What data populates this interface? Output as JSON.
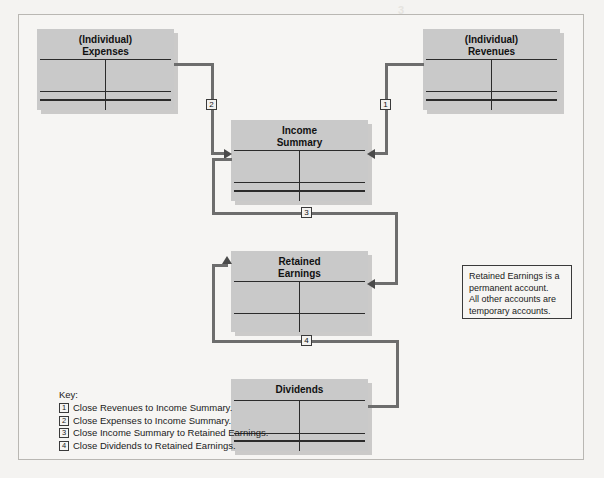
{
  "diagram": {
    "accounts": [
      {
        "id": "individual-expenses",
        "title_line1": "(Individual)",
        "title_line2": "Expenses"
      },
      {
        "id": "individual-revenues",
        "title_line1": "(Individual)",
        "title_line2": "Revenues"
      },
      {
        "id": "income-summary",
        "title_line1": "Income",
        "title_line2": "Summary"
      },
      {
        "id": "retained-earnings",
        "title_line1": "Retained",
        "title_line2": "Earnings"
      },
      {
        "id": "dividends",
        "title_line1": "Dividends",
        "title_line2": ""
      }
    ],
    "markers": {
      "one": "1",
      "two": "2",
      "three": "3",
      "four": "4"
    },
    "note": {
      "line1": "Retained Earnings is a",
      "line2": "permanent account.",
      "line3": "All other accounts are",
      "line4": "temporary accounts."
    },
    "key": {
      "title": "Key:",
      "items": [
        {
          "num": "1",
          "text": "Close Revenues to Income Summary."
        },
        {
          "num": "2",
          "text": "Close Expenses to Income Summary."
        },
        {
          "num": "3",
          "text": "Close Income Summary to Retained Earnings."
        },
        {
          "num": "4",
          "text": "Close Dividends to Retained Earnings."
        }
      ]
    },
    "colors": {
      "account_fill": "#c9c9c9",
      "connector": "#6d6d6d",
      "rule": "#2b2b2b",
      "page": "#f6f5f3"
    }
  },
  "background_text": {
    "top_mark": "3",
    "mid_right": "",
    "bottom_ghost": ""
  }
}
